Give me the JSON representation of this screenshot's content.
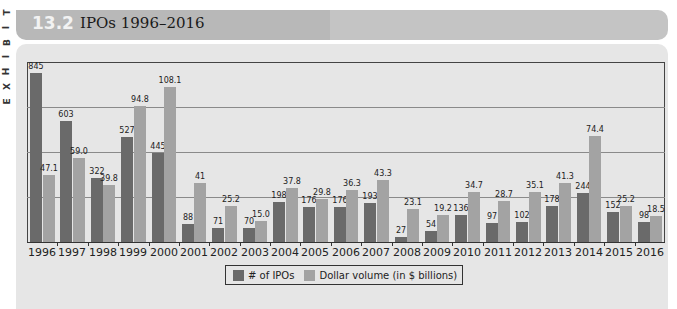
{
  "exhibit": {
    "side_label_letters": [
      "E",
      "X",
      "H",
      "I",
      "B",
      "I",
      "T"
    ],
    "number": "13.2",
    "title": "IPOs 1996–2016"
  },
  "colors": {
    "ipo_bar": "#6a6a6a",
    "volume_bar": "#a3a3a3",
    "panel_bg": "#e6e6e6",
    "title_bar_bg": "#b8b8b8"
  },
  "legend": {
    "items": [
      {
        "label": "# of IPOs",
        "color": "#6a6a6a"
      },
      {
        "label": "Dollar volume (in $ billions)",
        "color": "#a3a3a3"
      }
    ]
  },
  "chart_data": {
    "type": "bar",
    "title": "IPOs 1996–2016",
    "xlabel": "",
    "ylabel": "",
    "grid": true,
    "legend_position": "bottom",
    "categories": [
      "1996",
      "1997",
      "1998",
      "1999",
      "2000",
      "2001",
      "2002",
      "2003",
      "2004",
      "2005",
      "2006",
      "2007",
      "2008",
      "2009",
      "2010",
      "2011",
      "2012",
      "2013",
      "2014",
      "2015",
      "2016"
    ],
    "series": [
      {
        "name": "# of IPOs",
        "values": [
          845,
          603,
          322,
          527,
          445,
          88,
          71,
          70,
          198,
          176,
          176,
          193,
          27,
          54,
          136,
          97,
          102,
          178,
          244,
          152,
          98
        ],
        "labels": [
          "845",
          "603",
          "322",
          "527",
          "445",
          "88",
          "71",
          "70",
          "198",
          "176",
          "176",
          "193",
          "27",
          "54",
          "136",
          "97",
          "102",
          "178",
          "244",
          "152",
          "98"
        ]
      },
      {
        "name": "Dollar volume (in $ billions)",
        "values": [
          47.1,
          59.0,
          39.8,
          94.8,
          108.1,
          41,
          25.2,
          15.0,
          37.8,
          29.8,
          36.3,
          43.3,
          23.1,
          19.2,
          34.7,
          28.7,
          35.1,
          41.3,
          74.4,
          25.2,
          18.5
        ],
        "labels": [
          "47.1",
          "59.0",
          "39.8",
          "94.8",
          "108.1",
          "41",
          "25.2",
          "15.0",
          "37.8",
          "29.8",
          "36.3",
          "43.3",
          "23.1",
          "19.2",
          "34.7",
          "28.7",
          "35.1",
          "41.3",
          "74.4",
          "25.2",
          "18.5"
        ]
      }
    ],
    "layout": {
      "ipo_scale_px_per_unit": 0.2,
      "volume_scale_px_per_unit": 1.43,
      "gridline_count": 3,
      "axis_tick_labels_shown": false
    }
  }
}
